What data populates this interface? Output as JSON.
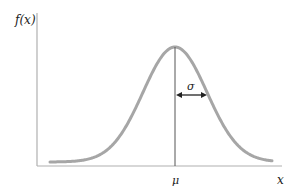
{
  "chart_data": {
    "type": "line",
    "title": "",
    "subtitle": "Normal distribution probability density function",
    "xlabel": "x",
    "ylabel": "f(x)",
    "legend": [],
    "grid": false,
    "series": [
      {
        "name": "f(x)",
        "distribution": "normal",
        "mean_label": "μ",
        "sigma_label": "σ",
        "color": "#a6a6a6"
      }
    ],
    "annotations": [
      {
        "type": "vertical-line",
        "at": "μ",
        "label": "μ",
        "color": "#444444"
      },
      {
        "type": "double-arrow",
        "from": "μ",
        "to": "μ+σ",
        "label": "σ",
        "color": "#222222"
      }
    ],
    "x_tick_labels": [
      "μ"
    ],
    "y_tick_labels": [],
    "xlim": [
      "μ-3.7σ",
      "μ+3.4σ"
    ],
    "ylim": [
      0,
      "f(μ)·1.3"
    ]
  },
  "labels": {
    "y_axis": "f(x)",
    "x_axis": "x",
    "mean": "μ",
    "sigma": "σ"
  },
  "colors": {
    "curve": "#a6a6a6",
    "axes": "#b0b0b0",
    "mean_line": "#555555",
    "arrow": "#222222",
    "text": "#222222"
  },
  "geometry": {
    "axis_origin_x": 37,
    "axis_origin_y": 166,
    "axis_top_y": 13,
    "axis_right_x": 282,
    "mu_x": 175,
    "peak_y": 47,
    "sigma_px": 32,
    "curve_left_x": 50,
    "curve_right_x": 272,
    "baseline_y": 162,
    "arrow_y": 95
  }
}
